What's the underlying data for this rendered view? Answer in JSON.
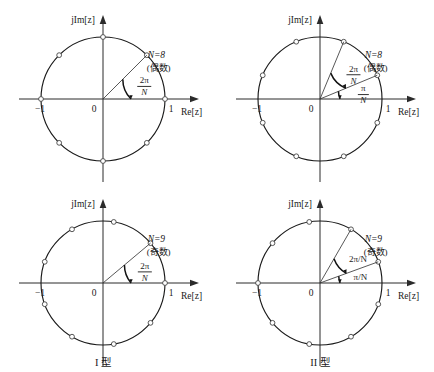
{
  "figure": {
    "background_color": "#ffffff",
    "stroke_color": "#1a1a1a",
    "panels": [
      {
        "id": "top-left",
        "position": "top-left",
        "N_label": "N=8",
        "parity_label": "(偶数)",
        "N_value": 8,
        "offset_label": null,
        "angle_label_numerator": "2π",
        "angle_label_denominator": "N",
        "angle_label_inline": null,
        "axis_imag": "jIm[z]",
        "axis_real": "Re[z]",
        "tick_left": "−1",
        "tick_origin": "0",
        "tick_right": "1",
        "marker_start_angle_deg": 0,
        "marker_count": 8,
        "marker_step_deg": 45
      },
      {
        "id": "top-right",
        "position": "top-right",
        "N_label": "N=8",
        "parity_label": "(偶数)",
        "N_value": 8,
        "offset_label_numerator": "π",
        "offset_label_denominator": "N",
        "angle_label_numerator": "2π",
        "angle_label_denominator": "N",
        "angle_label_inline": null,
        "axis_imag": "jIm[z]",
        "axis_real": "Re[z]",
        "tick_left": "−1",
        "tick_origin": "0",
        "tick_right": "1",
        "marker_start_angle_deg": 22.5,
        "marker_count": 8,
        "marker_step_deg": 45
      },
      {
        "id": "bottom-left",
        "position": "bottom-left",
        "N_label": "N=9",
        "parity_label": "(奇数)",
        "N_value": 9,
        "offset_label": null,
        "angle_label_numerator": "2π",
        "angle_label_denominator": "N",
        "angle_label_inline": null,
        "axis_imag": "jIm[z]",
        "axis_real": "Re[z]",
        "tick_left": "−1",
        "tick_origin": "0",
        "tick_right": "1",
        "marker_start_angle_deg": 0,
        "marker_count": 9,
        "marker_step_deg": 40
      },
      {
        "id": "bottom-right",
        "position": "bottom-right",
        "N_label": "N=9",
        "parity_label": "(奇数)",
        "N_value": 9,
        "offset_label_inline": "π/N",
        "angle_label_inline": "2π/N",
        "axis_imag": "jIm[z]",
        "axis_real": "Re[z]",
        "tick_left": "−1",
        "tick_origin": "0",
        "tick_right": "1",
        "marker_start_angle_deg": 20,
        "marker_count": 9,
        "marker_step_deg": 40
      }
    ],
    "captions": {
      "left": "I 型",
      "right": "II 型"
    }
  }
}
